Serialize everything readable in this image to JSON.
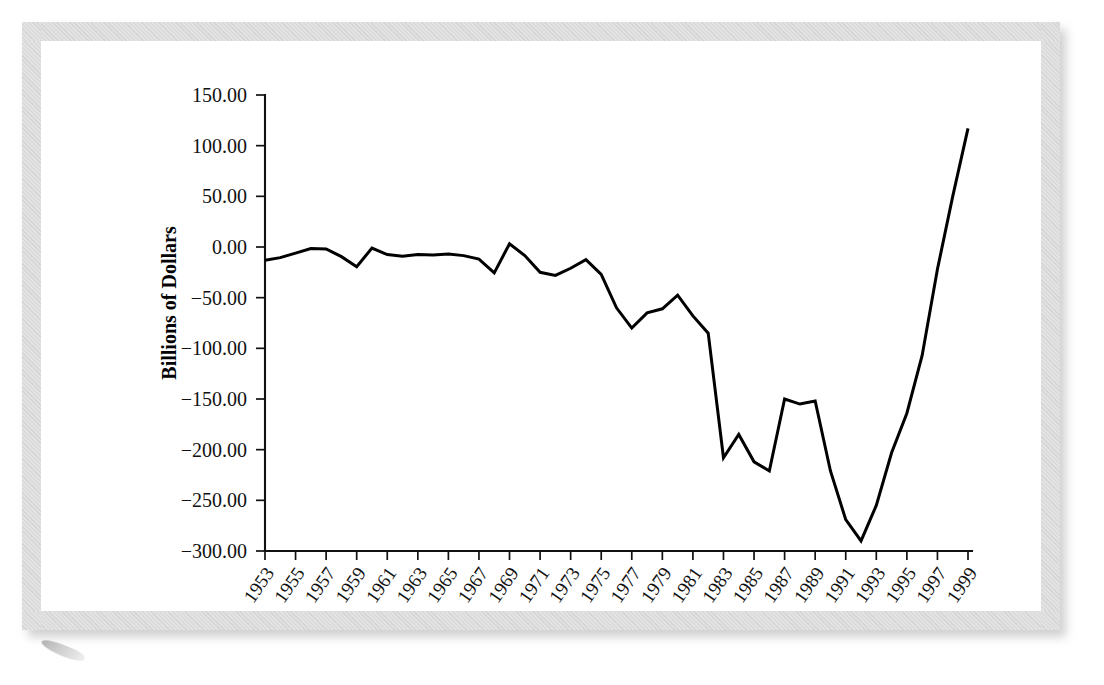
{
  "chart_data": {
    "type": "line",
    "title": "",
    "xlabel": "",
    "ylabel": "Billions of Dollars",
    "ylim": [
      -300,
      150
    ],
    "xlim": [
      1953,
      1999
    ],
    "grid": false,
    "legend": false,
    "ytick_labels": [
      "150.00",
      "100.00",
      "50.00",
      "0.00",
      "−50.00",
      "−100.00",
      "−150.00",
      "−200.00",
      "−250.00",
      "−300.00"
    ],
    "ytick_values": [
      150,
      100,
      50,
      0,
      -50,
      -100,
      -150,
      -200,
      -250,
      -300
    ],
    "xtick_labels": [
      "1953",
      "1955",
      "1957",
      "1959",
      "1961",
      "1963",
      "1965",
      "1967",
      "1969",
      "1971",
      "1973",
      "1975",
      "1977",
      "1979",
      "1981",
      "1983",
      "1985",
      "1987",
      "1989",
      "1991",
      "1993",
      "1995",
      "1997",
      "1999"
    ],
    "xtick_values": [
      1953,
      1955,
      1957,
      1959,
      1961,
      1963,
      1965,
      1967,
      1969,
      1971,
      1973,
      1975,
      1977,
      1979,
      1981,
      1983,
      1985,
      1987,
      1989,
      1991,
      1993,
      1995,
      1997,
      1999
    ],
    "x": [
      1953,
      1954,
      1955,
      1956,
      1957,
      1958,
      1959,
      1960,
      1961,
      1962,
      1963,
      1964,
      1965,
      1966,
      1967,
      1968,
      1969,
      1970,
      1971,
      1972,
      1973,
      1974,
      1975,
      1976,
      1977,
      1978,
      1979,
      1980,
      1981,
      1982,
      1983,
      1984,
      1985,
      1986,
      1987,
      1988,
      1989,
      1990,
      1991,
      1992,
      1993,
      1994,
      1995,
      1996,
      1997,
      1998,
      1999
    ],
    "values": [
      -13.0,
      -10.5,
      -6.0,
      -1.5,
      -2.0,
      -9.5,
      -19.5,
      -1.0,
      -7.5,
      -9.0,
      -7.5,
      -8.0,
      -7.0,
      -8.5,
      -12.0,
      -25.5,
      3.2,
      -8.5,
      -25.0,
      -28.0,
      -21.0,
      -12.5,
      -27.0,
      -60.0,
      -80.0,
      -65.0,
      -61.0,
      -47.5,
      -68.0,
      -85.0,
      -208.0,
      -185.0,
      -212.0,
      -221.0,
      -150.0,
      -155.0,
      -152.0,
      -221.0,
      -269.0,
      -290.0,
      -255.0,
      -203.0,
      -164.0,
      -107.0,
      -22.0,
      50.0,
      117.0
    ],
    "series_name": "Federal Budget Surplus/Deficit"
  }
}
